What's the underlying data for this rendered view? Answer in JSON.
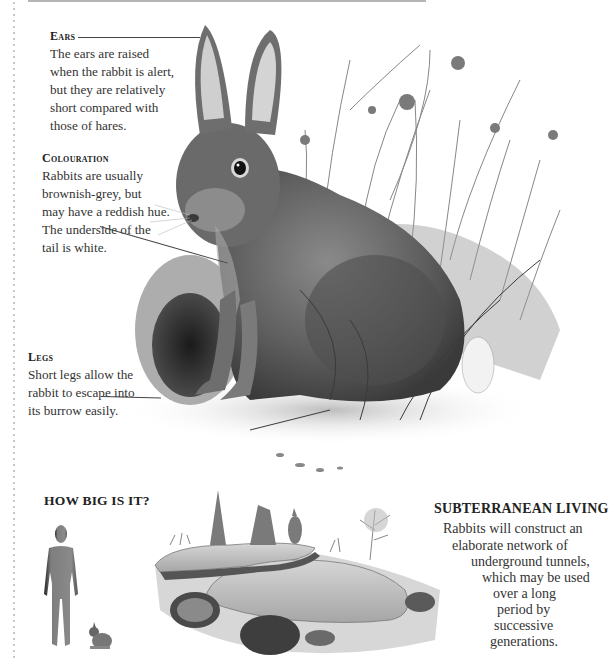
{
  "page": {
    "background": "#ffffff",
    "text_color": "#2b2b2b"
  },
  "callouts": {
    "ears": {
      "heading": "Ears",
      "lines": [
        "The ears are raised",
        "when the rabbit is alert,",
        "but they are relatively",
        "short compared with",
        "those of hares."
      ]
    },
    "colouration": {
      "heading": "Colouration",
      "lines": [
        "Rabbits are usually",
        "brownish-grey, but",
        "may have a reddish hue.",
        "The underside of the",
        "tail is white."
      ]
    },
    "legs": {
      "heading": "Legs",
      "lines": [
        "Short legs allow the",
        "rabbit to escape into",
        "its burrow easily."
      ]
    }
  },
  "how_big": {
    "title": "HOW BIG IS IT?",
    "human_icon": "human-silhouette-icon",
    "rabbit_icon": "rabbit-scale-icon"
  },
  "subterranean": {
    "title": "SUBTERRANEAN LIVING",
    "lines": [
      "Rabbits will construct an",
      "elaborate network of",
      "underground tunnels,",
      "which may be used",
      "over a long",
      "period by",
      "successive",
      "generations."
    ]
  },
  "illustrations": {
    "main": "rabbit-illustration",
    "burrow": "burrow-cross-section-illustration"
  }
}
